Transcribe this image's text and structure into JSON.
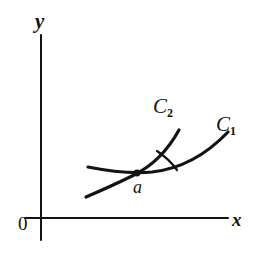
{
  "figure": {
    "background_color": "#ffffff",
    "ink_color": "#15130f",
    "width": 266,
    "height": 261
  },
  "axes": {
    "x_label": "x",
    "y_label": "y",
    "origin_label": "0",
    "x_axis": {
      "x_start": 25,
      "x_end": 228,
      "y": 218
    },
    "y_axis": {
      "x": 41,
      "y_start": 35,
      "y_end": 240
    }
  },
  "curves": [
    {
      "name": "curve-c1",
      "label_base": "C",
      "label_sub": "1",
      "label_full": "C₁",
      "description": "flatter curve rising gently to the right",
      "path": "M 88 167 C 108 171 128 174 152 172 C 180 169 206 155 228 132",
      "label_position": {
        "x": 216,
        "y": 114
      }
    },
    {
      "name": "curve-c2",
      "label_base": "C",
      "label_sub": "2",
      "label_full": "C₂",
      "description": "steeper curve rising sharply to the upper right",
      "path": "M 86 197 C 100 191 118 183 134 175 C 152 166 168 150 179 130",
      "label_position": {
        "x": 153,
        "y": 96
      }
    }
  ],
  "intersection": {
    "label": "a",
    "point": {
      "x": 137,
      "y": 173
    },
    "dot_radius": 3.4,
    "label_position": {
      "x": 133,
      "y": 178
    }
  },
  "angle_arc": {
    "name": "angle-between-curves",
    "path": "M 157 151 C 166 157 172 163 177 170",
    "from_curve": "curve-c2",
    "to_curve": "curve-c1"
  },
  "chart_data": {
    "type": "line",
    "xlabel": "x",
    "ylabel": "y",
    "grid": false,
    "legend": "inline-curve-labels",
    "series": [
      {
        "name": "C₁",
        "description": "gently rising curve through a"
      },
      {
        "name": "C₂",
        "description": "steeply rising curve through a"
      }
    ],
    "annotations": [
      "a",
      "0",
      "x",
      "y",
      "C₁",
      "C₂"
    ]
  }
}
